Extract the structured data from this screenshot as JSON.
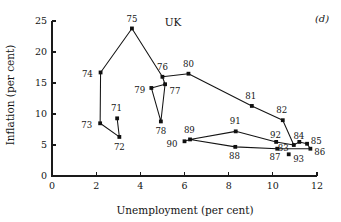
{
  "chart_data": {
    "type": "line",
    "title": "UK",
    "panel_label": "(d)",
    "xlabel": "Unemployment (per cent)",
    "ylabel": "Inflation (per cent)",
    "xlim": [
      0,
      12
    ],
    "ylim": [
      0,
      25
    ],
    "xticks": [
      0,
      2,
      4,
      6,
      8,
      10,
      12
    ],
    "yticks": [
      0,
      5,
      10,
      15,
      20,
      25
    ],
    "grid": false,
    "legend": "none",
    "series": [
      {
        "name": "UK unemployment vs inflation 1971-1993",
        "points": [
          {
            "label": "71",
            "x": 2.95,
            "y": 9.3,
            "lx": 2.92,
            "ly": 11.0,
            "anchor": "middle"
          },
          {
            "label": "72",
            "x": 3.05,
            "y": 6.3,
            "lx": 3.05,
            "ly": 4.6,
            "anchor": "middle"
          },
          {
            "label": "73",
            "x": 2.18,
            "y": 8.5,
            "lx": 1.82,
            "ly": 8.3,
            "anchor": "end"
          },
          {
            "label": "74",
            "x": 2.2,
            "y": 16.7,
            "lx": 1.85,
            "ly": 16.4,
            "anchor": "end"
          },
          {
            "label": "75",
            "x": 3.62,
            "y": 23.8,
            "lx": 3.62,
            "ly": 25.4,
            "anchor": "middle"
          },
          {
            "label": "76",
            "x": 5.0,
            "y": 16.0,
            "lx": 5.0,
            "ly": 17.6,
            "anchor": "middle"
          },
          {
            "label": "77",
            "x": 5.12,
            "y": 14.8,
            "lx": 5.32,
            "ly": 13.7,
            "anchor": "start"
          },
          {
            "label": "78",
            "x": 4.93,
            "y": 8.8,
            "lx": 4.93,
            "ly": 7.2,
            "anchor": "middle"
          },
          {
            "label": "79",
            "x": 4.5,
            "y": 14.2,
            "lx": 4.22,
            "ly": 13.8,
            "anchor": "end"
          },
          {
            "label": "80",
            "x": 6.18,
            "y": 16.5,
            "lx": 6.18,
            "ly": 18.1,
            "anchor": "middle"
          },
          {
            "label": "81",
            "x": 9.05,
            "y": 11.3,
            "lx": 9.0,
            "ly": 12.9,
            "anchor": "middle"
          },
          {
            "label": "82",
            "x": 10.45,
            "y": 9.0,
            "lx": 10.4,
            "ly": 10.6,
            "anchor": "middle"
          },
          {
            "label": "83",
            "x": 10.95,
            "y": 5.0,
            "lx": 10.72,
            "ly": 4.5,
            "anchor": "end"
          },
          {
            "label": "84",
            "x": 11.2,
            "y": 5.5,
            "lx": 11.18,
            "ly": 6.4,
            "anchor": "middle"
          },
          {
            "label": "85",
            "x": 11.55,
            "y": 5.2,
            "lx": 11.72,
            "ly": 5.6,
            "anchor": "start"
          },
          {
            "label": "86",
            "x": 11.7,
            "y": 4.4,
            "lx": 11.88,
            "ly": 3.9,
            "anchor": "start"
          },
          {
            "label": "87",
            "x": 10.2,
            "y": 4.4,
            "lx": 10.1,
            "ly": 3.0,
            "anchor": "middle"
          },
          {
            "label": "88",
            "x": 8.3,
            "y": 4.7,
            "lx": 8.26,
            "ly": 3.2,
            "anchor": "middle"
          },
          {
            "label": "89",
            "x": 6.25,
            "y": 5.9,
            "lx": 6.22,
            "ly": 7.4,
            "anchor": "middle"
          },
          {
            "label": "90",
            "x": 6.0,
            "y": 5.6,
            "lx": 5.68,
            "ly": 5.2,
            "anchor": "end"
          },
          {
            "label": "91",
            "x": 8.32,
            "y": 7.2,
            "lx": 8.3,
            "ly": 8.8,
            "anchor": "middle"
          },
          {
            "label": "92",
            "x": 10.15,
            "y": 5.5,
            "lx": 10.12,
            "ly": 6.6,
            "anchor": "middle"
          },
          {
            "label": "93",
            "x": 10.72,
            "y": 3.5,
            "lx": 10.92,
            "ly": 2.8,
            "anchor": "start"
          }
        ],
        "path_order": [
          "71",
          "72",
          "73",
          "74",
          "75",
          "76",
          "77",
          "79",
          "78",
          "77",
          "76",
          "80",
          "81",
          "82",
          "83",
          "84",
          "85",
          "86",
          "87",
          "88",
          "89",
          "90",
          "89",
          "91",
          "92",
          "83"
        ]
      }
    ]
  },
  "colors": {
    "ink": "#141414",
    "background": "#ffffff"
  }
}
